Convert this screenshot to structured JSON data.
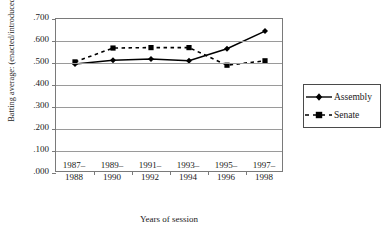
{
  "chart_data": {
    "type": "line",
    "title": "",
    "xlabel": "Years of session",
    "ylabel": "Batting average: (enacted/introduced)",
    "categories": [
      "1987–1988",
      "1989–1990",
      "1991–1992",
      "1993–1994",
      "1995–1996",
      "1997–1998"
    ],
    "series": [
      {
        "name": "Assembly",
        "values": [
          0.495,
          0.512,
          0.518,
          0.51,
          0.565,
          0.645
        ],
        "marker": "diamond",
        "linestyle": "solid",
        "color": "#000000"
      },
      {
        "name": "Senate",
        "values": [
          0.505,
          0.568,
          0.57,
          0.57,
          0.49,
          0.51
        ],
        "marker": "square",
        "linestyle": "dashed",
        "color": "#000000"
      }
    ],
    "ylim": [
      0.0,
      0.7
    ],
    "yticks": [
      0.0,
      0.1,
      0.2,
      0.3,
      0.4,
      0.5,
      0.6,
      0.7
    ],
    "ytick_labels": [
      ".000",
      ".100",
      ".200",
      ".300",
      ".400",
      ".500",
      ".600",
      ".700"
    ],
    "grid": true,
    "grid_axis": "y",
    "legend": [
      "Assembly",
      "Senate"
    ],
    "legend_position": "right",
    "background_color": "#ffffff",
    "axis_color": "#7a7a7a"
  },
  "axis": {
    "y_title": "Batting average: (enacted/introduced)",
    "x_title": "Years of session"
  },
  "legend": {
    "entries": [
      {
        "label": "Assembly"
      },
      {
        "label": "Senate"
      }
    ]
  }
}
